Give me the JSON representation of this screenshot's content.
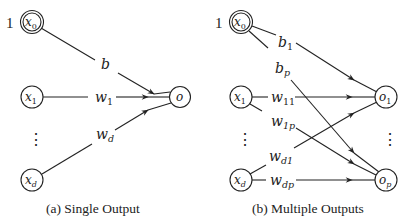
{
  "panel_a": {
    "caption": "(a) Single Output",
    "bias_value": "1",
    "nodes": {
      "x0": {
        "main": "x",
        "sub": "0"
      },
      "x1": {
        "main": "x",
        "sub": "1"
      },
      "xd": {
        "main": "x",
        "sub": "d"
      },
      "o": {
        "main": "o",
        "sub": ""
      }
    },
    "edges": {
      "b": {
        "main": "b",
        "sub": ""
      },
      "w1": {
        "main": "w",
        "sub": "1"
      },
      "wd": {
        "main": "w",
        "sub": "d"
      }
    },
    "ellipsis": "⋮"
  },
  "panel_b": {
    "caption": "(b) Multiple Outputs",
    "bias_value": "1",
    "nodes": {
      "x0": {
        "main": "x",
        "sub": "0"
      },
      "x1": {
        "main": "x",
        "sub": "1"
      },
      "xd": {
        "main": "x",
        "sub": "d"
      },
      "o1": {
        "main": "o",
        "sub": "1"
      },
      "op": {
        "main": "o",
        "sub": "p"
      }
    },
    "edges": {
      "b1": {
        "main": "b",
        "sub": "1"
      },
      "bp": {
        "main": "b",
        "sub": "p"
      },
      "w11": {
        "main": "w",
        "sub": "11"
      },
      "w1p": {
        "main": "w",
        "sub": "1p"
      },
      "wd1": {
        "main": "w",
        "sub": "d1"
      },
      "wdp": {
        "main": "w",
        "sub": "dp"
      }
    },
    "ellipsis_inputs": "⋮",
    "ellipsis_outputs": "⋮"
  }
}
